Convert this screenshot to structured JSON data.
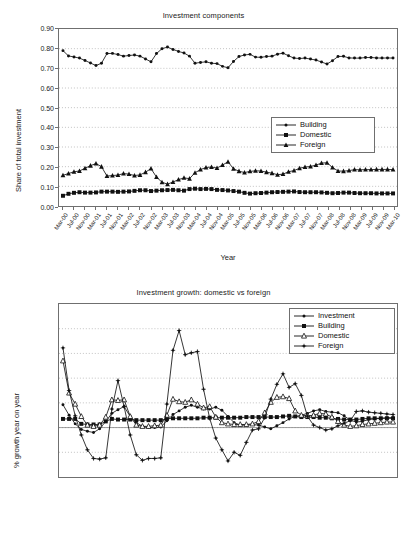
{
  "chart_data": [
    {
      "type": "line",
      "id": "investment-components",
      "title": "Investment components",
      "xlabel": "Year",
      "ylabel": "Share of total investment",
      "ylim": [
        0.0,
        0.9
      ],
      "ytick_labels": [
        "0.90",
        "0.80",
        "0.70",
        "0.60",
        "0.50",
        "0.40",
        "0.30",
        "0.20",
        "0.10",
        "0.00"
      ],
      "ytick_values": [
        0.9,
        0.8,
        0.7,
        0.6,
        0.5,
        0.4,
        0.3,
        0.2,
        0.1,
        0.0
      ],
      "grid": true,
      "legend_position": "right-middle",
      "tick_labels": [
        "Mar-00",
        "Jul-00",
        "Nov-00",
        "Mar-01",
        "Jul-01",
        "Nov-01",
        "Mar-02",
        "Jul-02",
        "Nov-02",
        "Mar-03",
        "Jul-03",
        "Nov-03",
        "Mar-04",
        "Jul-04",
        "Nov-04",
        "Mar-05",
        "Jul-05",
        "Nov-05",
        "Mar-06",
        "Jul-06",
        "Nov-06",
        "Mar-07",
        "Jul-07",
        "Nov-07",
        "Mar-08",
        "Jul-08",
        "Nov-08",
        "Mar-09",
        "Jul-09",
        "Nov-09",
        "Mar-10"
      ],
      "x": [
        "Mar-00",
        "May-00",
        "Jul-00",
        "Sep-00",
        "Nov-00",
        "Jan-01",
        "Mar-01",
        "May-01",
        "Jul-01",
        "Sep-01",
        "Nov-01",
        "Jan-02",
        "Mar-02",
        "May-02",
        "Jul-02",
        "Sep-02",
        "Nov-02",
        "Jan-03",
        "Mar-03",
        "May-03",
        "Jul-03",
        "Sep-03",
        "Nov-03",
        "Jan-04",
        "Mar-04",
        "May-04",
        "Jul-04",
        "Sep-04",
        "Nov-04",
        "Jan-05",
        "Mar-05",
        "May-05",
        "Jul-05",
        "Sep-05",
        "Nov-05",
        "Jan-06",
        "Mar-06",
        "May-06",
        "Jul-06",
        "Sep-06",
        "Nov-06",
        "Jan-07",
        "Mar-07",
        "May-07",
        "Jul-07",
        "Sep-07",
        "Nov-07",
        "Jan-08",
        "Mar-08",
        "May-08",
        "Jul-08",
        "Sep-08",
        "Nov-08",
        "Jan-09",
        "Mar-09",
        "May-09",
        "Jul-09",
        "Sep-09",
        "Nov-09",
        "Jan-10",
        "Mar-10"
      ],
      "series": [
        {
          "name": "Building",
          "marker": "small-dot",
          "values": [
            0.79,
            0.763,
            0.758,
            0.752,
            0.74,
            0.727,
            0.714,
            0.726,
            0.775,
            0.776,
            0.77,
            0.762,
            0.765,
            0.768,
            0.762,
            0.748,
            0.733,
            0.775,
            0.8,
            0.808,
            0.796,
            0.786,
            0.778,
            0.762,
            0.726,
            0.73,
            0.733,
            0.726,
            0.724,
            0.71,
            0.703,
            0.735,
            0.76,
            0.768,
            0.771,
            0.757,
            0.756,
            0.76,
            0.762,
            0.772,
            0.777,
            0.764,
            0.752,
            0.75,
            0.752,
            0.747,
            0.742,
            0.732,
            0.722,
            0.739,
            0.76,
            0.761,
            0.753,
            0.752,
            0.752,
            0.755,
            0.755,
            0.753,
            0.752,
            0.753,
            0.752
          ]
        },
        {
          "name": "Domestic",
          "marker": "filled-square",
          "values": [
            0.052,
            0.062,
            0.067,
            0.07,
            0.068,
            0.068,
            0.069,
            0.073,
            0.073,
            0.073,
            0.072,
            0.073,
            0.074,
            0.077,
            0.08,
            0.08,
            0.076,
            0.078,
            0.08,
            0.081,
            0.082,
            0.08,
            0.078,
            0.086,
            0.088,
            0.086,
            0.087,
            0.086,
            0.082,
            0.081,
            0.079,
            0.076,
            0.073,
            0.067,
            0.063,
            0.065,
            0.066,
            0.068,
            0.07,
            0.071,
            0.072,
            0.073,
            0.074,
            0.071,
            0.07,
            0.07,
            0.07,
            0.069,
            0.067,
            0.065,
            0.066,
            0.068,
            0.068,
            0.066,
            0.065,
            0.065,
            0.065,
            0.064,
            0.064,
            0.064,
            0.064
          ]
        },
        {
          "name": "Foreign",
          "marker": "filled-triangle",
          "values": [
            0.156,
            0.165,
            0.174,
            0.178,
            0.192,
            0.205,
            0.216,
            0.2,
            0.152,
            0.155,
            0.157,
            0.165,
            0.162,
            0.155,
            0.158,
            0.172,
            0.19,
            0.147,
            0.121,
            0.111,
            0.122,
            0.134,
            0.143,
            0.139,
            0.169,
            0.185,
            0.196,
            0.198,
            0.193,
            0.208,
            0.225,
            0.189,
            0.177,
            0.17,
            0.176,
            0.179,
            0.178,
            0.172,
            0.167,
            0.159,
            0.162,
            0.174,
            0.18,
            0.192,
            0.198,
            0.201,
            0.208,
            0.218,
            0.22,
            0.196,
            0.178,
            0.177,
            0.18,
            0.185,
            0.184,
            0.185,
            0.185,
            0.186,
            0.186,
            0.186,
            0.185
          ]
        }
      ]
    },
    {
      "type": "line",
      "id": "investment-growth",
      "title": "Investment growth: domestic vs foreign",
      "xlabel": "Year",
      "ylabel": "% growth year on year",
      "ylim": [
        -40.0,
        100.0
      ],
      "ytick_labels": [
        "100.00",
        "80.00",
        "60.00",
        "40.00",
        "20.00",
        "0.00",
        "-20.00",
        "-40.00"
      ],
      "ytick_values": [
        100,
        80,
        60,
        40,
        20,
        0,
        -20,
        -40
      ],
      "grid": true,
      "legend_position": "top-right",
      "tick_labels": [
        "Mar-01",
        "Jul-01",
        "Nov-01",
        "Mar-02",
        "Jul-02",
        "Nov-02",
        "Mar-03",
        "Jul-03",
        "Nov-03",
        "Mar-04",
        "Jul-04",
        "Nov-04",
        "Mar-05",
        "Jul-05",
        "Nov-05",
        "Mar-06",
        "Jul-06",
        "Nov-06",
        "Mar-07",
        "Jul-07",
        "Nov-07",
        "Mar-08",
        "Jul-08",
        "Nov-08",
        "Mar-09",
        "Jul-09",
        "Nov-09",
        "Mar-10"
      ],
      "x": [
        "Mar-01",
        "May-01",
        "Jul-01",
        "Sep-01",
        "Nov-01",
        "Jan-02",
        "Mar-02",
        "May-02",
        "Jul-02",
        "Sep-02",
        "Nov-02",
        "Jan-03",
        "Mar-03",
        "May-03",
        "Jul-03",
        "Sep-03",
        "Nov-03",
        "Jan-04",
        "Mar-04",
        "May-04",
        "Jul-04",
        "Sep-04",
        "Nov-04",
        "Jan-05",
        "Mar-05",
        "May-05",
        "Jul-05",
        "Sep-05",
        "Nov-05",
        "Jan-06",
        "Mar-06",
        "May-06",
        "Jul-06",
        "Sep-06",
        "Nov-06",
        "Jan-07",
        "Mar-07",
        "May-07",
        "Jul-07",
        "Sep-07",
        "Nov-07",
        "Jan-08",
        "Mar-08",
        "May-08",
        "Jul-08",
        "Sep-08",
        "Nov-08",
        "Jan-09",
        "Mar-09",
        "May-09",
        "Jul-09",
        "Sep-09",
        "Nov-09",
        "Jan-10",
        "Mar-10"
      ],
      "series": [
        {
          "name": "Investment",
          "marker": "small-dot",
          "values": [
            18.5,
            10.0,
            3.0,
            -1.5,
            -3.0,
            -4.0,
            -1.0,
            5.0,
            11.5,
            14.5,
            17.0,
            9.0,
            4.0,
            1.0,
            0.0,
            0.0,
            0.5,
            5.5,
            10.5,
            13.5,
            16.5,
            18.0,
            16.5,
            15.0,
            15.0,
            16.5,
            14.0,
            9.0,
            4.0,
            2.0,
            2.0,
            2.5,
            2.0,
            0.5,
            -1.0,
            1.5,
            4.0,
            7.0,
            9.0,
            10.0,
            11.5,
            13.5,
            14.5,
            13.0,
            12.5,
            12.0,
            9.5,
            6.0,
            4.5,
            5.0,
            6.5,
            7.0,
            7.5,
            8.0,
            8.0
          ]
        },
        {
          "name": "Building",
          "marker": "filled-square",
          "values": [
            7.0,
            7.0,
            7.0,
            3.0,
            2.5,
            2.5,
            2.5,
            5.0,
            7.0,
            6.5,
            6.5,
            6.5,
            6.0,
            6.0,
            6.0,
            6.0,
            6.0,
            7.0,
            7.5,
            7.5,
            7.5,
            7.5,
            7.5,
            8.0,
            8.0,
            8.0,
            8.0,
            8.0,
            8.0,
            8.0,
            8.5,
            8.5,
            8.5,
            8.5,
            8.5,
            8.5,
            9.0,
            9.5,
            9.0,
            8.5,
            8.5,
            8.5,
            8.0,
            8.0,
            7.5,
            7.0,
            6.5,
            6.5,
            6.5,
            7.0,
            7.5,
            7.5,
            7.5,
            7.5,
            7.5
          ]
        },
        {
          "name": "Domestic",
          "marker": "open-triangle",
          "values": [
            54.0,
            28.0,
            19.0,
            9.0,
            2.0,
            1.0,
            2.0,
            8.5,
            22.5,
            22.0,
            22.5,
            9.0,
            2.0,
            1.0,
            1.0,
            1.5,
            2.0,
            10.0,
            23.0,
            21.0,
            20.5,
            22.5,
            19.0,
            16.0,
            17.0,
            8.5,
            4.0,
            3.0,
            2.5,
            2.5,
            2.5,
            3.0,
            5.0,
            12.0,
            20.5,
            24.5,
            25.0,
            23.5,
            13.5,
            10.0,
            9.5,
            10.0,
            11.5,
            11.0,
            8.5,
            5.0,
            2.0,
            1.0,
            1.5,
            2.5,
            3.0,
            3.5,
            4.0,
            4.5,
            4.5
          ]
        },
        {
          "name": "Foreign",
          "marker": "star-dot",
          "values": [
            64.5,
            30.0,
            9.5,
            -6.0,
            -18.0,
            -25.0,
            -25.5,
            -24.5,
            15.0,
            38.0,
            17.0,
            -6.0,
            -22.0,
            -26.5,
            -25.0,
            -25.0,
            -24.5,
            19.0,
            62.5,
            78.5,
            59.0,
            60.5,
            61.5,
            31.0,
            7.5,
            -8.5,
            -18.0,
            -27.0,
            -20.0,
            -22.5,
            -12.0,
            -2.0,
            -1.0,
            8.0,
            23.0,
            35.0,
            43.5,
            32.5,
            35.5,
            26.0,
            9.0,
            2.0,
            0.0,
            -2.0,
            -1.0,
            1.5,
            3.5,
            5.5,
            13.0,
            13.5,
            12.5,
            12.0,
            11.5,
            11.0,
            10.5
          ]
        }
      ]
    }
  ]
}
